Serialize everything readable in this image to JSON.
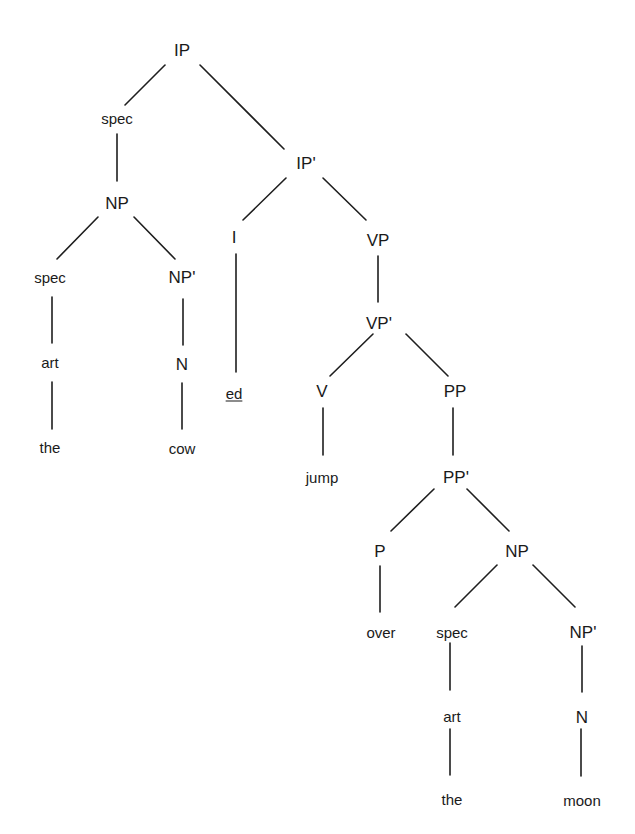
{
  "diagram": {
    "type": "syntax-tree",
    "sentence": "the cow jump ed over the moon",
    "edge_color": "#1e1e1e",
    "text_color": "#1a1a1a",
    "background": "#ffffff",
    "nodes": [
      {
        "id": "ip",
        "label": "IP",
        "x": 182,
        "y": 50,
        "kind": "phrase"
      },
      {
        "id": "spec1",
        "label": "spec",
        "x": 117,
        "y": 118,
        "kind": "spec"
      },
      {
        "id": "ipbar",
        "label": "IP'",
        "x": 306,
        "y": 163,
        "kind": "phrase"
      },
      {
        "id": "np1",
        "label": "NP",
        "x": 117,
        "y": 203,
        "kind": "phrase"
      },
      {
        "id": "i",
        "label": "I",
        "x": 234,
        "y": 237,
        "kind": "phrase"
      },
      {
        "id": "vp",
        "label": "VP",
        "x": 378,
        "y": 240,
        "kind": "phrase"
      },
      {
        "id": "spec2",
        "label": "spec",
        "x": 50,
        "y": 277,
        "kind": "spec"
      },
      {
        "id": "npbar1",
        "label": "NP'",
        "x": 182,
        "y": 277,
        "kind": "phrase"
      },
      {
        "id": "vpbar",
        "label": "VP'",
        "x": 379,
        "y": 323,
        "kind": "phrase"
      },
      {
        "id": "art1",
        "label": "art",
        "x": 50,
        "y": 362,
        "kind": "spec"
      },
      {
        "id": "n1",
        "label": "N",
        "x": 182,
        "y": 364,
        "kind": "phrase"
      },
      {
        "id": "ed",
        "label": "ed",
        "x": 234,
        "y": 393,
        "kind": "word",
        "underline": true
      },
      {
        "id": "v",
        "label": "V",
        "x": 322,
        "y": 391,
        "kind": "phrase"
      },
      {
        "id": "pp",
        "label": "PP",
        "x": 455,
        "y": 391,
        "kind": "phrase"
      },
      {
        "id": "the1",
        "label": "the",
        "x": 50,
        "y": 447,
        "kind": "word"
      },
      {
        "id": "cow",
        "label": "cow",
        "x": 182,
        "y": 448,
        "kind": "word"
      },
      {
        "id": "jump",
        "label": "jump",
        "x": 322,
        "y": 477,
        "kind": "word"
      },
      {
        "id": "ppbar",
        "label": "PP'",
        "x": 456,
        "y": 477,
        "kind": "phrase"
      },
      {
        "id": "p",
        "label": "P",
        "x": 380,
        "y": 551,
        "kind": "phrase"
      },
      {
        "id": "np2",
        "label": "NP",
        "x": 517,
        "y": 551,
        "kind": "phrase"
      },
      {
        "id": "over",
        "label": "over",
        "x": 381,
        "y": 632,
        "kind": "word"
      },
      {
        "id": "spec3",
        "label": "spec",
        "x": 452,
        "y": 632,
        "kind": "spec"
      },
      {
        "id": "npbar2",
        "label": "NP'",
        "x": 583,
        "y": 632,
        "kind": "phrase"
      },
      {
        "id": "art2",
        "label": "art",
        "x": 452,
        "y": 716,
        "kind": "spec"
      },
      {
        "id": "n2",
        "label": "N",
        "x": 582,
        "y": 717,
        "kind": "phrase"
      },
      {
        "id": "the2",
        "label": "the",
        "x": 452,
        "y": 799,
        "kind": "word"
      },
      {
        "id": "moon",
        "label": "moon",
        "x": 582,
        "y": 800,
        "kind": "word"
      }
    ],
    "edges": [
      {
        "from": "ip",
        "to": "spec1",
        "x1": 165,
        "y1": 65,
        "x2": 125,
        "y2": 105
      },
      {
        "from": "ip",
        "to": "ipbar",
        "x1": 200,
        "y1": 65,
        "x2": 284,
        "y2": 149
      },
      {
        "from": "spec1",
        "to": "np1",
        "x1": 117,
        "y1": 134,
        "x2": 117,
        "y2": 181
      },
      {
        "from": "ipbar",
        "to": "i",
        "x1": 286,
        "y1": 178,
        "x2": 243,
        "y2": 220
      },
      {
        "from": "ipbar",
        "to": "vp",
        "x1": 323,
        "y1": 178,
        "x2": 366,
        "y2": 220
      },
      {
        "from": "np1",
        "to": "spec2",
        "x1": 98,
        "y1": 217,
        "x2": 57,
        "y2": 259
      },
      {
        "from": "np1",
        "to": "npbar1",
        "x1": 134,
        "y1": 217,
        "x2": 175,
        "y2": 259
      },
      {
        "from": "i",
        "to": "ed",
        "x1": 236,
        "y1": 254,
        "x2": 236,
        "y2": 372
      },
      {
        "from": "vp",
        "to": "vpbar",
        "x1": 378,
        "y1": 256,
        "x2": 378,
        "y2": 302
      },
      {
        "from": "spec2",
        "to": "art1",
        "x1": 52,
        "y1": 297,
        "x2": 52,
        "y2": 343
      },
      {
        "from": "npbar1",
        "to": "n1",
        "x1": 183,
        "y1": 299,
        "x2": 183,
        "y2": 345
      },
      {
        "from": "vpbar",
        "to": "v",
        "x1": 373,
        "y1": 334,
        "x2": 330,
        "y2": 376
      },
      {
        "from": "vpbar",
        "to": "pp",
        "x1": 406,
        "y1": 334,
        "x2": 448,
        "y2": 376
      },
      {
        "from": "art1",
        "to": "the1",
        "x1": 52,
        "y1": 382,
        "x2": 52,
        "y2": 429
      },
      {
        "from": "n1",
        "to": "cow",
        "x1": 182,
        "y1": 383,
        "x2": 182,
        "y2": 429
      },
      {
        "from": "v",
        "to": "jump",
        "x1": 323,
        "y1": 408,
        "x2": 323,
        "y2": 455
      },
      {
        "from": "pp",
        "to": "ppbar",
        "x1": 453,
        "y1": 408,
        "x2": 453,
        "y2": 455
      },
      {
        "from": "ppbar",
        "to": "p",
        "x1": 434,
        "y1": 489,
        "x2": 391,
        "y2": 531
      },
      {
        "from": "ppbar",
        "to": "np2",
        "x1": 467,
        "y1": 489,
        "x2": 509,
        "y2": 531
      },
      {
        "from": "p",
        "to": "over",
        "x1": 380,
        "y1": 566,
        "x2": 380,
        "y2": 612
      },
      {
        "from": "np2",
        "to": "spec3",
        "x1": 497,
        "y1": 565,
        "x2": 455,
        "y2": 607
      },
      {
        "from": "np2",
        "to": "npbar2",
        "x1": 533,
        "y1": 565,
        "x2": 575,
        "y2": 607
      },
      {
        "from": "spec3",
        "to": "art2",
        "x1": 450,
        "y1": 643,
        "x2": 450,
        "y2": 690
      },
      {
        "from": "npbar2",
        "to": "n2",
        "x1": 582,
        "y1": 646,
        "x2": 582,
        "y2": 692
      },
      {
        "from": "art2",
        "to": "the2",
        "x1": 450,
        "y1": 729,
        "x2": 450,
        "y2": 775
      },
      {
        "from": "n2",
        "to": "moon",
        "x1": 581,
        "y1": 729,
        "x2": 581,
        "y2": 776
      }
    ]
  }
}
